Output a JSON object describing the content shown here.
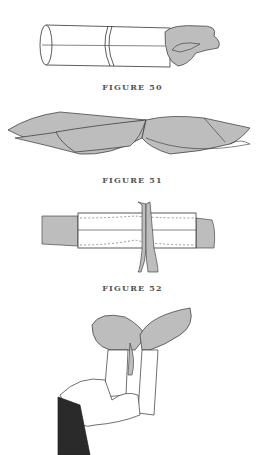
{
  "page": {
    "figures": [
      {
        "id": "figure-50",
        "caption": "FIGURE 50",
        "depicts": "cylindrical tube with band and cloth emerging from right end"
      },
      {
        "id": "figure-51",
        "caption": "FIGURE 51",
        "depicts": "two cloths tied together in a bow/knot"
      },
      {
        "id": "figure-52",
        "caption": "FIGURE 52",
        "depicts": "tube with dashed inner outline being cut by scissors in middle, cloth at ends"
      },
      {
        "id": "figure-53",
        "caption": "",
        "depicts": "hand holding two tubes with cloths emerging from tops"
      }
    ]
  },
  "colors": {
    "background": "#ffffff",
    "line": "#333333",
    "cloth": "#bdbdbd",
    "sleeve": "#2a2a2a",
    "caption": "#555555"
  }
}
